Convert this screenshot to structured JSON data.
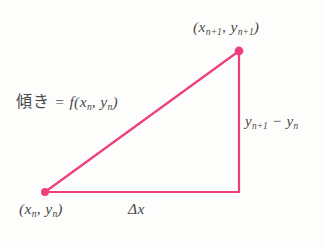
{
  "figure": {
    "background_color": "#fdfdfc",
    "stroke_color": "#ee3e7e",
    "text_color": "#4a4a4a",
    "labels": {
      "top_vertex": "(x",
      "top_vertex_sub1": "n+1",
      "top_vertex_mid": ", y",
      "top_vertex_sub2": "n+1",
      "top_vertex_end": ")",
      "bottom_vertex": "(x",
      "bottom_vertex_sub1": "n",
      "bottom_vertex_mid": ", y",
      "bottom_vertex_sub2": "n",
      "bottom_vertex_end": ")",
      "slope_jp": "傾き",
      "slope_eq": " = f(x",
      "slope_sub1": "n",
      "slope_mid": ", y",
      "slope_sub2": "n",
      "slope_end": ")",
      "delta_y_start": "y",
      "delta_y_sub1": "n+1",
      "delta_y_minus": " − y",
      "delta_y_sub2": "n",
      "delta_x": "Δx"
    },
    "geometry": {
      "bottom_left_x": 45,
      "bottom_left_y": 192,
      "bottom_right_x": 239,
      "bottom_right_y": 192,
      "top_right_x": 239,
      "top_right_y": 51,
      "line_width": 2.2,
      "vertex_dot_radius": 4
    }
  }
}
